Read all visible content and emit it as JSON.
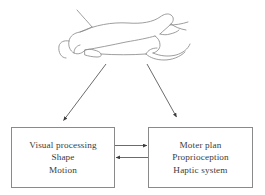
{
  "figure": {
    "background_color": "#ffffff",
    "line_color": "#8a8a8a",
    "text_color": "#3b3b3b",
    "arrow_color": "#555555"
  },
  "illustration": {
    "name": "two-hands-grasping-object",
    "description": "Line drawing of two hands holding an elongated object horizontally"
  },
  "boxes": [
    {
      "id": "visual",
      "lines": [
        "Visual processing",
        "Shape",
        "Motion"
      ]
    },
    {
      "id": "motor",
      "lines": [
        "Moter plan",
        "Proprioception",
        "Haptic system"
      ]
    }
  ],
  "arrows": [
    {
      "name": "illustration-to-visual",
      "direction": "down-left",
      "from": "illustration",
      "to": "visual-box"
    },
    {
      "name": "illustration-to-motor",
      "direction": "down-right",
      "from": "illustration",
      "to": "motor-box"
    },
    {
      "name": "visual-to-motor",
      "direction": "right",
      "from": "visual-box",
      "to": "motor-box"
    },
    {
      "name": "motor-to-visual",
      "direction": "left",
      "from": "motor-box",
      "to": "visual-box"
    }
  ]
}
